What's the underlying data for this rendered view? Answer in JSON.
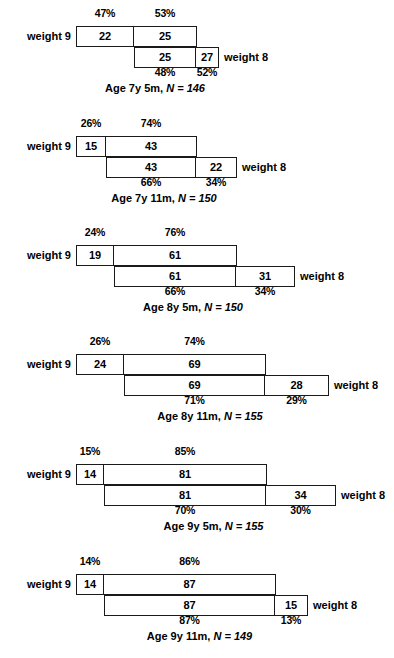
{
  "figure": {
    "title": "",
    "left_label": "weight 9",
    "right_label": "weight 8"
  },
  "chart_data": {
    "type": "table",
    "title": "",
    "row_label": "weight 9",
    "column_label": "weight 8",
    "panels": [
      {
        "id": "panel-1",
        "caption_prefix": "Age 7y 5m,",
        "caption_n": "N = 146",
        "n": 146,
        "counts": {
          "a": 22,
          "b": 25,
          "c": 25,
          "d": 27
        },
        "top_percents": [
          "47%",
          "53%"
        ],
        "bottom_percents": [
          "48%",
          "52%"
        ],
        "geom": {
          "x0": 76,
          "x1": 134,
          "x2": 196,
          "x3": 218
        }
      },
      {
        "id": "panel-2",
        "caption_prefix": "Age 7y 11m,",
        "caption_n": "N = 150",
        "n": 150,
        "counts": {
          "a": 15,
          "b": 43,
          "c": 43,
          "d": 22
        },
        "top_percents": [
          "26%",
          "74%"
        ],
        "bottom_percents": [
          "66%",
          "34%"
        ],
        "geom": {
          "x0": 76,
          "x1": 106,
          "x2": 196,
          "x3": 236
        }
      },
      {
        "id": "panel-3",
        "caption_prefix": "Age 8y 5m,",
        "caption_n": "N = 150",
        "n": 150,
        "counts": {
          "a": 19,
          "b": 61,
          "c": 61,
          "d": 31
        },
        "top_percents": [
          "24%",
          "76%"
        ],
        "bottom_percents": [
          "66%",
          "34%"
        ],
        "geom": {
          "x0": 76,
          "x1": 114,
          "x2": 236,
          "x3": 294
        }
      },
      {
        "id": "panel-4",
        "caption_prefix": "Age 8y 11m,",
        "caption_n": "N = 155",
        "n": 155,
        "counts": {
          "a": 24,
          "b": 69,
          "c": 69,
          "d": 28
        },
        "top_percents": [
          "26%",
          "74%"
        ],
        "bottom_percents": [
          "71%",
          "29%"
        ],
        "geom": {
          "x0": 76,
          "x1": 124,
          "x2": 265,
          "x3": 328
        }
      },
      {
        "id": "panel-5",
        "caption_prefix": "Age 9y 5m,",
        "caption_n": "N = 155",
        "n": 155,
        "counts": {
          "a": 14,
          "b": 81,
          "c": 81,
          "d": 34
        },
        "top_percents": [
          "15%",
          "85%"
        ],
        "bottom_percents": [
          "70%",
          "30%"
        ],
        "geom": {
          "x0": 76,
          "x1": 104,
          "x2": 266,
          "x3": 335
        }
      },
      {
        "id": "panel-6",
        "caption_prefix": "Age 9y 11m,",
        "caption_n": "N = 149",
        "n": 149,
        "counts": {
          "a": 14,
          "b": 87,
          "c": 87,
          "d": 15
        },
        "top_percents": [
          "14%",
          "86%"
        ],
        "bottom_percents": [
          "87%",
          "13%"
        ],
        "geom": {
          "x0": 76,
          "x1": 104,
          "x2": 275,
          "x3": 307
        }
      }
    ]
  }
}
